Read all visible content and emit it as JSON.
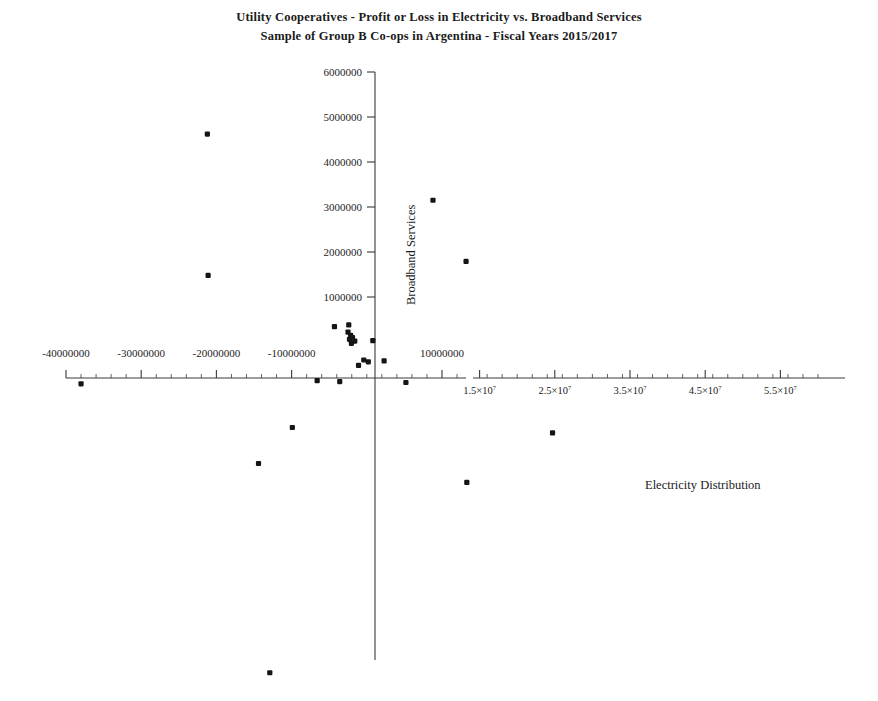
{
  "chart_data": {
    "type": "scatter",
    "title": "Utility Cooperatives  - Profit or Loss in Electricity vs. Broadband Services",
    "subtitle": "Sample of Group B Co-ops in Argentina - Fiscal Years 2015/2017",
    "xlabel": "Electricity Distribution",
    "ylabel": "Broadband Services",
    "xlim": [
      -44000000,
      60000000
    ],
    "ylim": [
      -10500000,
      6400000
    ],
    "grid": false,
    "legend": null,
    "x_tick_labels": [
      "-40000000",
      "-30000000",
      "-20000000",
      "-10000000",
      "10000000",
      "1.5×10",
      "2.5×10",
      "3.5×10",
      "4.5×10",
      "5.5×10"
    ],
    "x_tick_values": [
      -40000000,
      -30000000,
      -20000000,
      -10000000,
      10000000,
      15000000,
      25000000,
      35000000,
      45000000,
      55000000
    ],
    "x_tick_exponent": "7",
    "y_tick_labels": [
      "1000000",
      "2000000",
      "3000000",
      "4000000",
      "5000000",
      "6000000"
    ],
    "y_tick_values": [
      1000000,
      2000000,
      3000000,
      4000000,
      5000000,
      6000000
    ],
    "points": [
      {
        "x": -21200000,
        "y": 4620000
      },
      {
        "x": -21100000,
        "y": 1480000
      },
      {
        "x": 8800000,
        "y": 3150000
      },
      {
        "x": 13200000,
        "y": 1790000
      },
      {
        "x": -4300000,
        "y": 340000
      },
      {
        "x": -2400000,
        "y": 380000
      },
      {
        "x": -2500000,
        "y": 220000
      },
      {
        "x": -2150000,
        "y": 150000
      },
      {
        "x": -2300000,
        "y": 60000
      },
      {
        "x": -1900000,
        "y": 100000
      },
      {
        "x": -2050000,
        "y": -30000
      },
      {
        "x": 800000,
        "y": 30000
      },
      {
        "x": -1600000,
        "y": 20000
      },
      {
        "x": -400000,
        "y": -400000
      },
      {
        "x": 200000,
        "y": -440000
      },
      {
        "x": 2300000,
        "y": -420000
      },
      {
        "x": -1100000,
        "y": -520000
      },
      {
        "x": -38000000,
        "y": -930000
      },
      {
        "x": -6600000,
        "y": -860000
      },
      {
        "x": -3600000,
        "y": -880000
      },
      {
        "x": 5200000,
        "y": -900000
      },
      {
        "x": -9900000,
        "y": -1900000
      },
      {
        "x": -14400000,
        "y": -2700000
      },
      {
        "x": 24700000,
        "y": -2020000
      },
      {
        "x": 13300000,
        "y": -3120000
      },
      {
        "x": -12900000,
        "y": -7350000
      }
    ]
  }
}
